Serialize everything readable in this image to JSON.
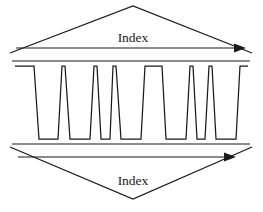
{
  "figure": {
    "background_color": "#ffffff",
    "stroke_color": "#1a1a1a",
    "width": 263,
    "height": 212
  },
  "top_index": {
    "label": "Index",
    "label_x": 133,
    "label_y": 42,
    "triangle_points": "10,53 133,6 252,53",
    "arrow_line_y": 48,
    "arrow_x_start": 16,
    "arrow_x_end": 238,
    "arrow_head": "246,48 234,43.5 234,52.5"
  },
  "bottom_index": {
    "label": "Index",
    "label_x": 133,
    "label_y": 185,
    "triangle_points": "10,147 133,199 252,147",
    "arrow_line_y": 157,
    "arrow_x_start": 18,
    "arrow_x_end": 228,
    "arrow_head": "236,157 224,152.5 224,161.5"
  },
  "signal": {
    "name": "pulse-waveform",
    "high_level_y": 66,
    "low_level_y": 139,
    "baseline_left_x": 15,
    "baseline_right_x": 248,
    "path": "M15,66 L34,66 L39,139 L58,139 L62,66 L65,66 L70,139 L90,139 L94,66 L97,66 L101,139 L110,139 L113,66 L116,66 L121,139 L141,139 L145,66 L162,66 L166,139 L186,139 L190,66 L193,66 L197,139 L205,139 L209,66 L212,66 L216,139 L236,139 L240,66 L248,66",
    "top_rail_y": 61,
    "top_rail_x_start": 12,
    "top_rail_x_end": 250,
    "bottom_rail_y": 144,
    "bottom_rail_x_start": 12,
    "bottom_rail_x_end": 250
  }
}
